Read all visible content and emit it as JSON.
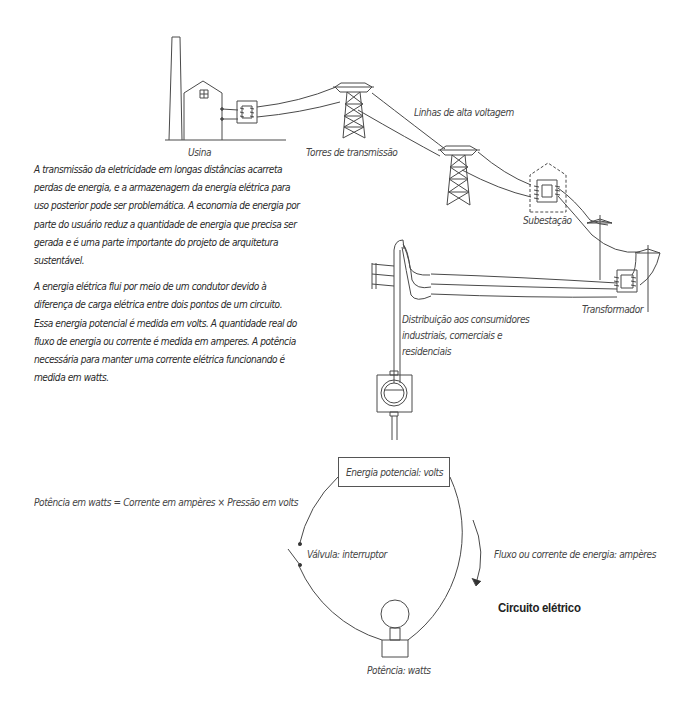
{
  "diagram": {
    "type": "electric-power-transmission-and-circuit",
    "language": "pt-BR",
    "stroke_color": "#4a4a4a",
    "text_color": "#333333"
  },
  "transmission": {
    "labels": {
      "plant": "Usina",
      "towers": "Torres de transmissão",
      "high_voltage_lines": "Linhas de alta voltagem",
      "substation": "Subestação",
      "transformer": "Transformador",
      "distribution_line1": "Distribuição aos consumidores",
      "distribution_line2": "industriais, comerciais e",
      "distribution_line3": "residenciais"
    }
  },
  "text": {
    "paragraph1": "A transmissão da eletricidade em longas distâncias acarreta perdas de energia, e a armazenagem da energia elétrica para uso posterior pode ser problemática. A economia de energia por parte do usuário reduz a quantidade de energia que precisa ser gerada e é uma parte importante do projeto de arquitetura sustentável.",
    "paragraph2_a": "A energia elétrica flui por meio de um condutor devido à diferença de carga elétrica entre dois pontos de um circuito. Essa energia potencial é medida em ",
    "paragraph2_volts": "volts",
    "paragraph2_b": ". A quantidade real do fluxo de energia ou corrente é medida em ",
    "paragraph2_amperes": "amperes",
    "paragraph2_c": ". A potência necessária para manter uma corrente elétrica funcionando é medida em ",
    "paragraph2_watts": "watts",
    "paragraph2_d": "."
  },
  "circuit": {
    "title": "Circuito elétrico",
    "formula": "Potência em watts = Corrente em ampères × Pressão em volts",
    "source_label": "Energia potencial: volts",
    "switch_label": "Válvula: interruptor",
    "flow_label": "Fluxo ou corrente de energia: ampères",
    "load_label": "Potência: watts"
  }
}
